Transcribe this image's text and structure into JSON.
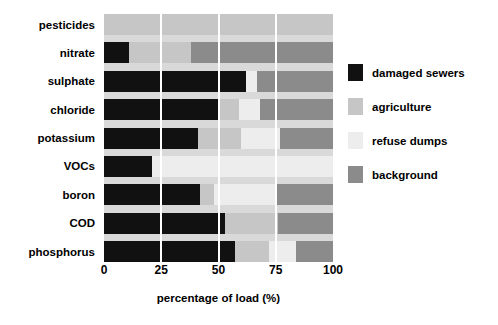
{
  "chart_data": {
    "type": "bar",
    "orientation": "horizontal",
    "stacked": true,
    "title": "",
    "xlabel": "percentage of load (%)",
    "ylabel": "",
    "xlim": [
      0,
      100
    ],
    "xticks": [
      "0",
      "25",
      "50",
      "75",
      "100"
    ],
    "xtick_values": [
      0,
      25,
      50,
      75,
      100
    ],
    "grid": true,
    "grid_color": "#ffffff",
    "plot_background": "#d9d9d9",
    "legend_position": "right",
    "categories": [
      "pesticides",
      "nitrate",
      "sulphate",
      "chloride",
      "potassium",
      "VOCs",
      "boron",
      "COD",
      "phosphorus"
    ],
    "series": [
      {
        "name": "damaged sewers",
        "color": "#111111",
        "values": [
          0,
          11,
          62,
          50,
          41,
          21,
          42,
          53,
          57
        ]
      },
      {
        "name": "agriculture",
        "color": "#c6c6c6",
        "values": [
          100,
          27,
          0,
          9,
          19,
          0,
          6,
          23,
          15
        ]
      },
      {
        "name": "refuse dumps",
        "color": "#ededed",
        "values": [
          0,
          0,
          5,
          9,
          17,
          79,
          27,
          0,
          12
        ]
      },
      {
        "name": "background",
        "color": "#8b8b8b",
        "values": [
          0,
          62,
          33,
          32,
          23,
          0,
          25,
          24,
          16
        ]
      }
    ]
  },
  "axis": {
    "x_label": "percentage of load (%)",
    "ticks": [
      "0",
      "25",
      "50",
      "75",
      "100"
    ]
  },
  "legend": {
    "items": [
      {
        "label": "damaged sewers",
        "color": "#111111"
      },
      {
        "label": "agriculture",
        "color": "#c6c6c6"
      },
      {
        "label": "refuse dumps",
        "color": "#ededed"
      },
      {
        "label": "background",
        "color": "#8b8b8b"
      }
    ]
  }
}
